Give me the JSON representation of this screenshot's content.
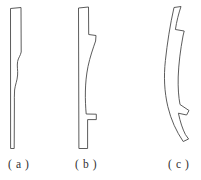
{
  "figure": {
    "background_color": "#ffffff",
    "line_color": "#4a4a4a",
    "panels": [
      {
        "id": "a",
        "caption": "( a )",
        "description": "straight slender specimen with slight S-shaped kink in the mid-height of the right edge"
      },
      {
        "id": "b",
        "caption": "( b )",
        "description": "slender specimen with outward bulging curved right edge between two step notches"
      },
      {
        "id": "c",
        "caption": "( c )",
        "description": "strongly curved crescent specimen with a step notch near the upper third and a tapered lower tip"
      }
    ]
  },
  "captions": {
    "a": "( a )",
    "b": "( b )",
    "c": "( c )"
  }
}
